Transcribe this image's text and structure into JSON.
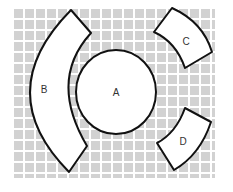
{
  "diagram": {
    "grid": {
      "x": 13,
      "y": 8,
      "width": 202,
      "height": 170,
      "cell_pitch": 11,
      "cell_size": 9,
      "cell_color": "#d2d2d2",
      "gap_color": "#ffffff"
    },
    "shapes": [
      {
        "id": "A",
        "label": "A",
        "kind": "circle",
        "label_x": 116,
        "label_y": 93
      },
      {
        "id": "B",
        "label": "B",
        "kind": "arc-segment",
        "label_x": 44,
        "label_y": 90
      },
      {
        "id": "C",
        "label": "C",
        "kind": "arc-segment",
        "label_x": 186,
        "label_y": 42
      },
      {
        "id": "D",
        "label": "D",
        "kind": "arc-segment",
        "label_x": 183,
        "label_y": 142
      }
    ],
    "stroke_color": "#111111",
    "fill_color": "#ffffff"
  }
}
